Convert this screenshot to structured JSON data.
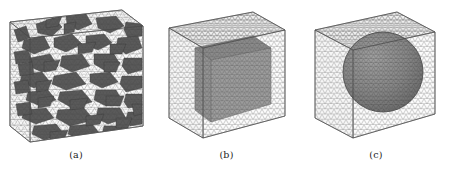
{
  "figure": {
    "background_color": "#ffffff",
    "panel_count": 3,
    "mesh_line_color": "#8a8a8a",
    "inclusion_color": "#6b6b6b",
    "aggregate_color": "#4a4a4a",
    "edge_color": "#555555"
  },
  "panels": [
    {
      "id": "panel-a",
      "caption": "(a)",
      "kind": "box-mesh-with-random-polyhedral-aggregates",
      "shape": "rectangular-box",
      "inclusion_shape": "irregular-polyhedra",
      "inclusion_count": 46,
      "description": "Rectangular specimen meshed with triangular surface elements, filled with randomly distributed dark polyhedral aggregate particles",
      "width_px": 143,
      "height_px": 133
    },
    {
      "id": "panel-b",
      "caption": "(b)",
      "kind": "cube-mesh-with-cubic-inclusion",
      "shape": "cube",
      "inclusion_shape": "cube",
      "inclusion_count": 1,
      "description": "Cubic domain meshed with triangular surface elements containing a single darker cubic inclusion",
      "width_px": 126,
      "height_px": 136
    },
    {
      "id": "panel-c",
      "caption": "(c)",
      "kind": "cube-mesh-with-spherical-inclusion",
      "shape": "cube",
      "inclusion_shape": "sphere",
      "inclusion_count": 1,
      "description": "Cubic domain meshed with triangular surface elements containing a single darker spherical inclusion",
      "width_px": 132,
      "height_px": 136
    }
  ]
}
